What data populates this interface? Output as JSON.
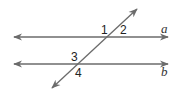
{
  "diagram": {
    "type": "parallel-lines-transversal",
    "line_color": "#6b6b6b",
    "lines": [
      {
        "id": "a",
        "label": "a",
        "x1": 14,
        "y1": 37,
        "x2": 168,
        "y2": 37
      },
      {
        "id": "b",
        "label": "b",
        "x1": 14,
        "y1": 64,
        "x2": 168,
        "y2": 64
      }
    ],
    "transversal": {
      "x1": 52,
      "y1": 88,
      "x2": 137,
      "y2": 9
    },
    "angles": [
      {
        "label": "1",
        "x": 101,
        "y": 33
      },
      {
        "label": "2",
        "x": 121,
        "y": 33
      },
      {
        "label": "3",
        "x": 72,
        "y": 60
      },
      {
        "label": "4",
        "x": 76,
        "y": 76
      }
    ]
  }
}
